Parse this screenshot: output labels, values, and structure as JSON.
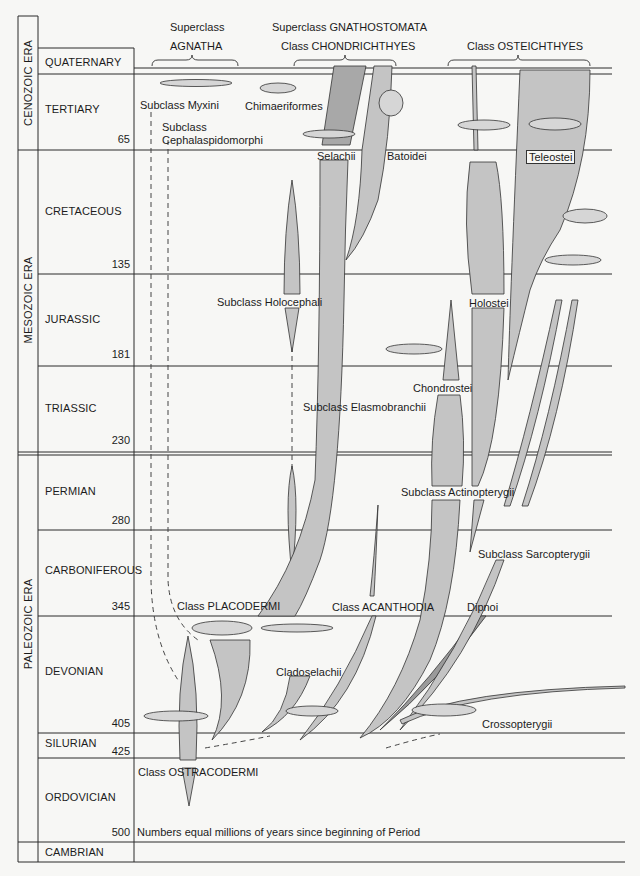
{
  "colors": {
    "background": "#f7f7f5",
    "line": "#2a2a2a",
    "branch_fill": "#c4c4c4",
    "branch_dark": "#9a9a9a"
  },
  "eras": [
    {
      "name": "CENOZOIC ERA"
    },
    {
      "name": "MESOZOIC ERA"
    },
    {
      "name": "PALEOZOIC ERA"
    }
  ],
  "periods": [
    {
      "name": "QUATERNARY",
      "mya": ""
    },
    {
      "name": "TERTIARY",
      "mya": "65"
    },
    {
      "name": "CRETACEOUS",
      "mya": "135"
    },
    {
      "name": "JURASSIC",
      "mya": "181"
    },
    {
      "name": "TRIASSIC",
      "mya": "230"
    },
    {
      "name": "PERMIAN",
      "mya": "280"
    },
    {
      "name": "CARBONIFEROUS",
      "mya": "345"
    },
    {
      "name": "DEVONIAN",
      "mya": "405"
    },
    {
      "name": "SILURIAN",
      "mya": "425"
    },
    {
      "name": "ORDOVICIAN",
      "mya": "500"
    },
    {
      "name": "CAMBRIAN",
      "mya": ""
    }
  ],
  "headers": {
    "agnatha_super": "Superclass",
    "agnatha_name": "AGNATHA",
    "gnatho": "Superclass GNATHOSTOMATA",
    "chondr": "Class CHONDRICHTHYES",
    "osteich": "Class OSTEICHTHYES"
  },
  "taxa": {
    "myxini": "Subclass Myxini",
    "cephalaspido_1": "Subclass",
    "cephalaspido_2": "Cephalaspidomorphi",
    "chimaeriformes": "Chimaeriformes",
    "selachii": "Selachii",
    "batoidei": "Batoidei",
    "teleostei": "Teleostei",
    "holocephali": "Subclass Holocephali",
    "holostei": "Holostei",
    "chondrostei": "Chondrostei",
    "elasmobranchii": "Subclass Elasmobranchii",
    "actinopterygii": "Subclass  Actinopterygii",
    "sarcopterygii": "Subclass Sarcopterygii",
    "placodermi": "Class  PLACODERMI",
    "acanthodia": "Class ACANTHODIA",
    "dipnoi": "Dipnoi",
    "cladoselachii": "Cladoselachii",
    "crossopterygii": "Crossopterygii",
    "ostracodermi": "Class OSTRACODERMI"
  },
  "footnote": "Numbers equal millions of years since beginning of Period"
}
